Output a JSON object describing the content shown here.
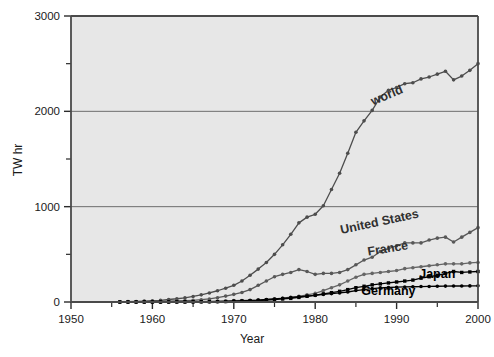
{
  "chart_data": {
    "type": "line",
    "title": "",
    "xlabel": "Year",
    "ylabel": "TW hr",
    "xlim": [
      1950,
      2000
    ],
    "ylim": [
      0,
      3000
    ],
    "grid": "horizontal-major",
    "legend_position": "inline-annotations",
    "x_ticks_major": [
      1950,
      1960,
      1970,
      1980,
      1990,
      2000
    ],
    "x_ticks_minor": [
      1955,
      1965,
      1975,
      1985,
      1995
    ],
    "y_ticks_major": [
      0,
      1000,
      2000,
      3000
    ],
    "y_ticks_minor": [
      500,
      1500,
      2500
    ],
    "x_tick_labels": [
      "1950",
      "1960",
      "1970",
      "1980",
      "1990",
      "2000"
    ],
    "y_tick_labels": [
      "0",
      "1000",
      "2000",
      "3000"
    ],
    "x": [
      1956,
      1957,
      1958,
      1959,
      1960,
      1961,
      1962,
      1963,
      1964,
      1965,
      1966,
      1967,
      1968,
      1969,
      1970,
      1971,
      1972,
      1973,
      1974,
      1975,
      1976,
      1977,
      1978,
      1979,
      1980,
      1981,
      1982,
      1983,
      1984,
      1985,
      1986,
      1987,
      1988,
      1989,
      1990,
      1991,
      1992,
      1993,
      1994,
      1995,
      1996,
      1997,
      1998,
      1999,
      2000
    ],
    "series": [
      {
        "name": "world",
        "color": "#4d4d4d",
        "marker": "circle",
        "values": [
          2,
          4,
          6,
          9,
          13,
          18,
          26,
          34,
          44,
          58,
          75,
          95,
          118,
          145,
          175,
          220,
          280,
          345,
          415,
          500,
          600,
          710,
          830,
          890,
          920,
          1010,
          1180,
          1350,
          1560,
          1780,
          1900,
          2010,
          2150,
          2220,
          2250,
          2290,
          2300,
          2340,
          2360,
          2390,
          2420,
          2330,
          2370,
          2430,
          2500
        ]
      },
      {
        "name": "United States",
        "color": "#585858",
        "marker": "circle",
        "values": [
          1,
          2,
          3,
          4,
          5,
          6,
          8,
          11,
          14,
          18,
          24,
          32,
          45,
          62,
          80,
          100,
          130,
          175,
          220,
          265,
          290,
          310,
          340,
          320,
          290,
          300,
          300,
          310,
          340,
          390,
          440,
          470,
          530,
          560,
          590,
          620,
          620,
          620,
          650,
          670,
          680,
          630,
          680,
          730,
          780
        ]
      },
      {
        "name": "France",
        "color": "#656565",
        "marker": "circle",
        "values": [
          0,
          0,
          0,
          0,
          1,
          1,
          2,
          2,
          3,
          4,
          5,
          6,
          8,
          10,
          14,
          16,
          18,
          20,
          24,
          32,
          40,
          50,
          60,
          75,
          90,
          120,
          150,
          180,
          220,
          260,
          290,
          300,
          310,
          320,
          330,
          350,
          360,
          370,
          380,
          390,
          400,
          400,
          400,
          410,
          415
        ]
      },
      {
        "name": "Japan",
        "color": "#000000",
        "marker": "square",
        "values": [
          0,
          0,
          0,
          0,
          0,
          0,
          0,
          1,
          1,
          2,
          2,
          3,
          4,
          5,
          7,
          9,
          12,
          15,
          20,
          26,
          32,
          38,
          48,
          60,
          72,
          85,
          98,
          112,
          130,
          150,
          165,
          180,
          190,
          200,
          210,
          220,
          230,
          250,
          265,
          280,
          300,
          320,
          310,
          315,
          320
        ]
      },
      {
        "name": "Germany",
        "color": "#000000",
        "marker": "circle",
        "values": [
          0,
          0,
          0,
          0,
          0,
          0,
          0,
          0,
          1,
          1,
          2,
          3,
          4,
          6,
          9,
          12,
          16,
          20,
          26,
          32,
          38,
          46,
          55,
          62,
          70,
          80,
          88,
          95,
          105,
          120,
          130,
          140,
          148,
          152,
          155,
          158,
          160,
          162,
          163,
          165,
          167,
          168,
          168,
          169,
          170
        ]
      }
    ],
    "annotations": [
      {
        "text": "world",
        "series": "world",
        "x": 1989,
        "y": 2130,
        "rotation": -23,
        "weight": "bold"
      },
      {
        "text": "United States",
        "series": "United States",
        "x": 1988,
        "y": 800,
        "rotation": -12,
        "weight": "bold"
      },
      {
        "text": "France",
        "series": "France",
        "x": 1989,
        "y": 520,
        "rotation": -9,
        "weight": "bold"
      },
      {
        "text": "Japan",
        "series": "Japan",
        "x": 1995,
        "y": 255,
        "rotation": 0,
        "weight": "bold"
      },
      {
        "text": "Germany",
        "series": "Germany",
        "x": 1989,
        "y": 75,
        "rotation": 0,
        "weight": "bold"
      }
    ],
    "style": {
      "plot_background": "#e7e7e7",
      "frame_color": "#4a4a4a",
      "gridline_color": "#6e6e6e",
      "page_background": "#ffffff",
      "tick_color": "#2b2b2b"
    }
  }
}
